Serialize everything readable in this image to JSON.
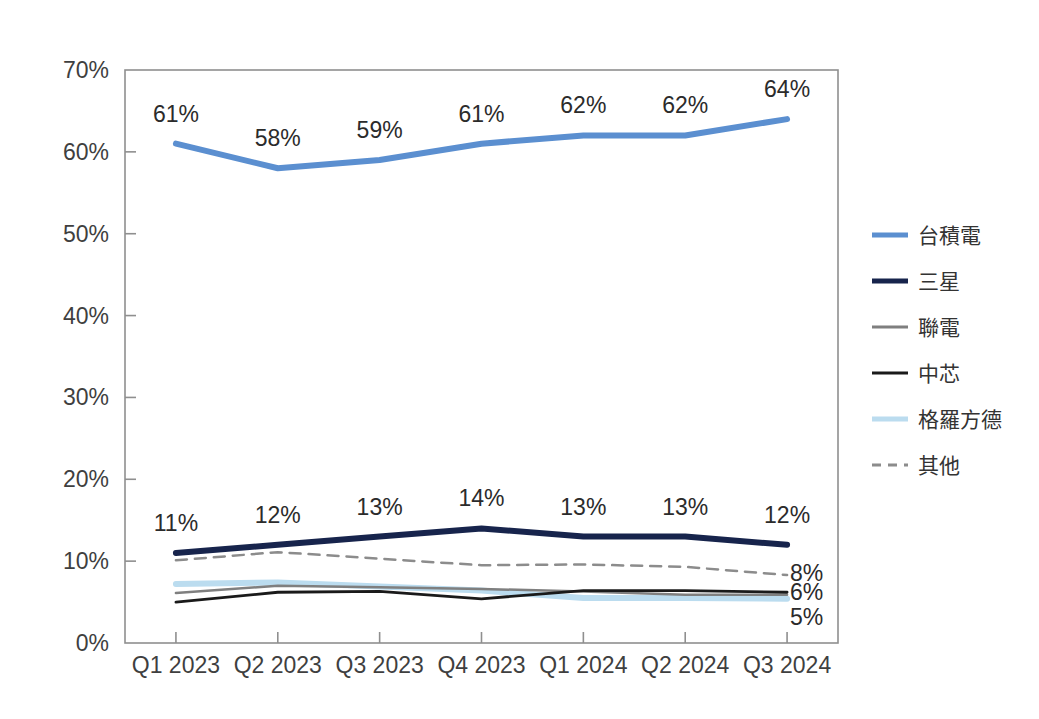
{
  "chart_data": {
    "type": "line",
    "title": "",
    "subtitle": "",
    "xlabel": "",
    "ylabel": "",
    "categories": [
      "Q1 2023",
      "Q2 2023",
      "Q3 2023",
      "Q4 2023",
      "Q1 2024",
      "Q2 2024",
      "Q3 2024"
    ],
    "ylim": [
      0,
      70
    ],
    "ytick_values": [
      0,
      10,
      20,
      30,
      40,
      50,
      60,
      70
    ],
    "ytick_labels": [
      "0%",
      "10%",
      "20%",
      "30%",
      "40%",
      "50%",
      "60%",
      "70%"
    ],
    "grid": false,
    "legend_position": "right",
    "series": [
      {
        "name": "台積電",
        "color": "#5B8FD0",
        "style": "solid",
        "width": 6,
        "values": [
          61,
          58,
          59,
          61,
          62,
          62,
          64
        ],
        "point_labels": [
          "61%",
          "58%",
          "59%",
          "61%",
          "62%",
          "62%",
          "64%"
        ],
        "end_label": ""
      },
      {
        "name": "三星",
        "color": "#17244C",
        "style": "solid",
        "width": 6,
        "values": [
          11,
          12,
          13,
          14,
          13,
          13,
          12
        ],
        "point_labels": [
          "11%",
          "12%",
          "13%",
          "14%",
          "13%",
          "13%",
          "12%"
        ],
        "end_label": ""
      },
      {
        "name": "聯電",
        "color": "#7F7F7F",
        "style": "solid",
        "width": 2.5,
        "values": [
          6.1,
          7.0,
          6.8,
          6.6,
          6.3,
          5.9,
          5.9
        ],
        "point_labels": [],
        "end_label": ""
      },
      {
        "name": "中芯",
        "color": "#1A1A1A",
        "style": "solid",
        "width": 2.8,
        "values": [
          5.0,
          6.2,
          6.3,
          5.4,
          6.4,
          6.4,
          6.2
        ],
        "point_labels": [],
        "end_label": "6%"
      },
      {
        "name": "格羅方德",
        "color": "#BBDCEF",
        "style": "solid",
        "width": 6,
        "values": [
          7.2,
          7.4,
          6.9,
          6.4,
          5.5,
          5.5,
          5.4
        ],
        "point_labels": [],
        "end_label": "5%"
      },
      {
        "name": "其他",
        "color": "#8C8C8C",
        "style": "dashed",
        "width": 2.5,
        "values": [
          10.1,
          11.1,
          10.3,
          9.5,
          9.6,
          9.3,
          8.3
        ],
        "point_labels": [],
        "end_label": "8%"
      }
    ],
    "end_labels": [
      {
        "text": "8%",
        "series": "其他"
      },
      {
        "text": "6%",
        "series": "中芯"
      },
      {
        "text": "5%",
        "series": "格羅方德"
      }
    ]
  },
  "legend": {
    "items": [
      {
        "label": "台積電"
      },
      {
        "label": "三星"
      },
      {
        "label": "聯電"
      },
      {
        "label": "中芯"
      },
      {
        "label": "格羅方德"
      },
      {
        "label": "其他"
      }
    ]
  }
}
